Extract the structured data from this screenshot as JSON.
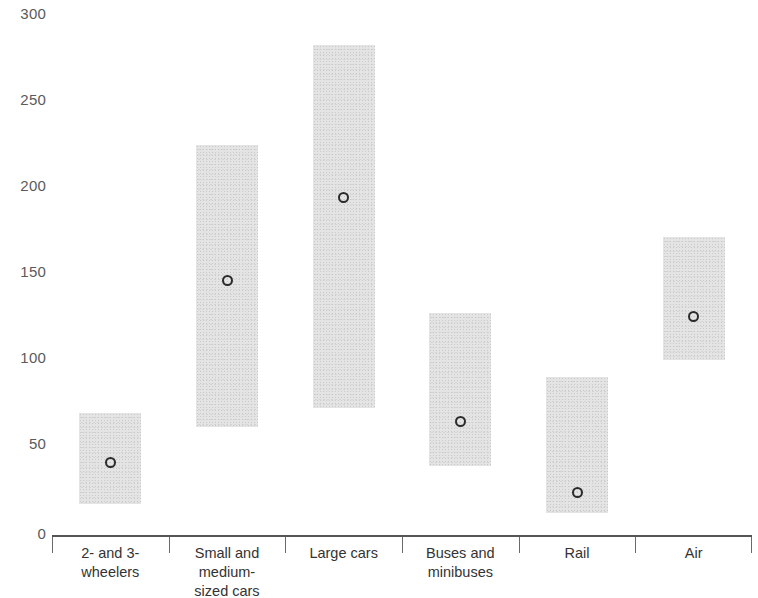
{
  "chart_data": {
    "type": "bar",
    "title": "",
    "subtitle": "",
    "xlabel": "",
    "ylabel": "",
    "ylim": [
      0,
      300
    ],
    "yticks": [
      0,
      50,
      100,
      150,
      200,
      250,
      300
    ],
    "ytick_labels": [
      "0",
      "50",
      "100",
      "150",
      "200",
      "250",
      "300"
    ],
    "grid": false,
    "legend": null,
    "series_description": "Shaded bars show the range (low to high); open circle marks the central/point estimate.",
    "categories": [
      "2- and 3-\nwheelers",
      "Small and\nmedium-\nsized cars",
      "Large cars",
      "Buses and\nminibuses",
      "Rail",
      "Air"
    ],
    "series": [
      {
        "name": "Range low",
        "values": [
          18,
          63,
          74,
          40,
          13,
          102
        ]
      },
      {
        "name": "Range high",
        "values": [
          71,
          227,
          285,
          129,
          92,
          173
        ]
      },
      {
        "name": "Central estimate",
        "values": [
          42,
          148,
          196,
          66,
          25,
          127
        ]
      }
    ],
    "colors": {
      "bar_fill": "#e2e2e2",
      "bar_speckle": "#c4c4c4",
      "marker_stroke": "#2b2b2b",
      "axis": "#555555",
      "tick_label": "#5b5b5b",
      "category_label": "#333333"
    }
  },
  "axis": {
    "y_labels": [
      "300",
      "250",
      "200",
      "150",
      "100",
      "50",
      "0"
    ]
  },
  "categories": [
    {
      "id": "two-and-three-wheelers",
      "label": "2- and 3-\nwheelers"
    },
    {
      "id": "small-and-medium-sized-cars",
      "label": "Small and\nmedium-\nsized cars"
    },
    {
      "id": "large-cars",
      "label": "Large cars"
    },
    {
      "id": "buses-and-minibuses",
      "label": "Buses and\nminibuses"
    },
    {
      "id": "rail",
      "label": "Rail"
    },
    {
      "id": "air",
      "label": "Air"
    }
  ]
}
